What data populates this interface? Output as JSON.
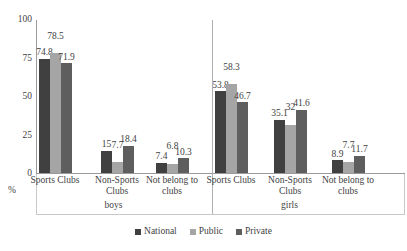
{
  "chart_data": {
    "type": "bar",
    "title": "",
    "subtitle": "",
    "xlabel": "",
    "ylabel": "%",
    "ylim": [
      0,
      100
    ],
    "yticks": [
      "0",
      "25",
      "50",
      "75",
      "100"
    ],
    "grid": false,
    "legend_position": "bottom",
    "legend": [
      "National",
      "Public",
      "Private"
    ],
    "series": [
      {
        "name": "National",
        "color": "#404040",
        "values": [
          74.8,
          15,
          7.4,
          53.8,
          35.1,
          8.9
        ],
        "labels": [
          "74.8",
          "15",
          "7.4",
          "53.8",
          "35.1",
          "8.9"
        ]
      },
      {
        "name": "Public",
        "color": "#a5a5a5",
        "values": [
          78.5,
          7.7,
          6.8,
          58.3,
          32,
          7.7
        ],
        "labels": [
          "78.5",
          "7.7",
          "6.8",
          "58.3",
          "32",
          "7.7"
        ]
      },
      {
        "name": "Private",
        "color": "#5e5e5e",
        "values": [
          71.9,
          18.4,
          10.3,
          46.7,
          41.6,
          11.7
        ],
        "labels": [
          "71.9",
          "18.4",
          "10.3",
          "46.7",
          "41.6",
          "11.7"
        ]
      }
    ],
    "categories": [
      "Sports Clubs",
      "Non-Sports Clubs",
      "Not belong to clubs",
      "Sports Clubs",
      "Non-Sports Clubs",
      "Not belong to clubs"
    ],
    "supergroups": [
      {
        "label": "boys",
        "categories": [
          0,
          1,
          2
        ]
      },
      {
        "label": "girls",
        "categories": [
          3,
          4,
          5
        ]
      }
    ]
  },
  "axis": {
    "unit_label": "%"
  }
}
